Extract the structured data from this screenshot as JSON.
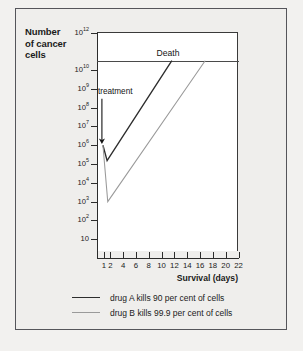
{
  "figure": {
    "y_axis_title_lines": [
      "Number",
      "of cancer",
      "cells"
    ],
    "x_axis_title": "Survival (days)",
    "death_label": "Death",
    "treatment_label": "treatment"
  },
  "legend": {
    "items": [
      {
        "label": "drug A kills 90 per cent of cells",
        "color": "#2d2d2d"
      },
      {
        "label": "drug B kills 99.9 per cent of cells",
        "color": "#9a9a9a"
      }
    ]
  },
  "chart_data": {
    "type": "line",
    "title": "",
    "subtitle": "",
    "xlabel": "Survival (days)",
    "ylabel": "Number of cancer cells",
    "yscale": "log",
    "ylim": [
      1,
      1000000000000
    ],
    "xlim": [
      0,
      22
    ],
    "grid": false,
    "legend_position": "below-plot",
    "y_tick_values": [
      1000000000000,
      10000000000,
      1000000000,
      100000000,
      10000000,
      1000000,
      100000,
      10000,
      1000,
      100,
      10
    ],
    "y_tick_labels": [
      "10^12",
      "10^10",
      "10^9",
      "10^8",
      "10^7",
      "10^6",
      "10^5",
      "10^4",
      "10^3",
      "10^2",
      "10"
    ],
    "x_tick_values": [
      1,
      2,
      4,
      6,
      8,
      10,
      12,
      14,
      16,
      18,
      20,
      22
    ],
    "x_tick_labels": [
      "1",
      "2",
      "4",
      "6",
      "8",
      "10",
      "12",
      "14",
      "16",
      "18",
      "20",
      "22"
    ],
    "annotations": [
      {
        "text": "Death",
        "type": "threshold-line",
        "y": 31600000000,
        "x_span": [
          0,
          22
        ]
      },
      {
        "text": "treatment",
        "type": "arrow",
        "x": 1,
        "y_from": 300000000,
        "y_to": 1000000
      }
    ],
    "series": [
      {
        "name": "drug A kills 90 per cent of cells",
        "color": "#2d2d2d",
        "points": [
          {
            "x": 0.85,
            "y": 1000000
          },
          {
            "x": 1.5,
            "y": 150000
          },
          {
            "x": 11.6,
            "y": 31600000000
          }
        ]
      },
      {
        "name": "drug B kills 99.9 per cent of cells",
        "color": "#9a9a9a",
        "points": [
          {
            "x": 0.85,
            "y": 1000000
          },
          {
            "x": 1.6,
            "y": 1000
          },
          {
            "x": 16.8,
            "y": 31600000000
          }
        ]
      }
    ]
  }
}
